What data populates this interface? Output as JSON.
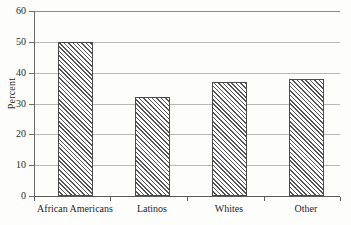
{
  "chart_data": {
    "type": "bar",
    "title": "",
    "xlabel": "",
    "ylabel": "Percent",
    "categories": [
      "African Americans",
      "Latinos",
      "Whites",
      "Other"
    ],
    "values": [
      50,
      32,
      37,
      38
    ],
    "ylim": [
      0,
      60
    ],
    "ytick_labels": [
      "0",
      "10",
      "20",
      "30",
      "40",
      "50",
      "60"
    ],
    "ytick_values": [
      0,
      10,
      20,
      30,
      40,
      50,
      60
    ],
    "grid": "horizontal",
    "legend": "none",
    "series": [
      {
        "name": "Percent",
        "values": [
          50,
          32,
          37,
          38
        ]
      }
    ],
    "style": {
      "bar_fill": "#ffffff",
      "bar_hatch": "forward-diagonal",
      "bar_outline": "#4a4a4a",
      "gridline_color": "#b9b9b9",
      "axis_color": "#5a5a5a",
      "background": "#fdfdfc",
      "text_color": "#1f1f1f"
    }
  }
}
